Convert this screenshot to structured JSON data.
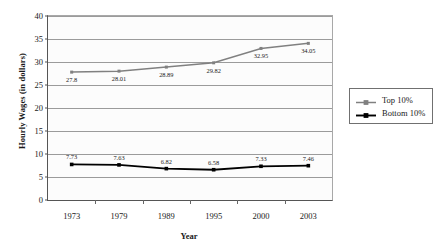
{
  "chart_data": {
    "type": "line",
    "title": "",
    "xlabel": "Year",
    "ylabel": "Hourly Wages (in dollars)",
    "categories": [
      "1973",
      "1979",
      "1989",
      "1995",
      "2000",
      "2003"
    ],
    "ylim": [
      0,
      40
    ],
    "yticks": [
      0,
      5,
      10,
      15,
      20,
      25,
      30,
      35,
      40
    ],
    "ytick_labels": [
      "0",
      "5",
      "10",
      "15",
      "20",
      "25",
      "30",
      "35",
      "40"
    ],
    "grid": "horizontal",
    "legend_position": "right",
    "series": [
      {
        "name": "Top 10%",
        "color": "#808080",
        "marker": "square",
        "values": [
          27.8,
          28.01,
          28.89,
          29.82,
          32.95,
          34.05
        ],
        "data_labels": [
          "27.8",
          "28.01",
          "28.89",
          "29.82",
          "32.95",
          "34.05"
        ]
      },
      {
        "name": "Bottom 10%",
        "color": "#000000",
        "marker": "square",
        "values": [
          7.73,
          7.63,
          6.82,
          6.58,
          7.33,
          7.46
        ],
        "data_labels": [
          "7.73",
          "7.63",
          "6.82",
          "6.58",
          "7.33",
          "7.46"
        ]
      }
    ]
  },
  "legend": {
    "items": [
      {
        "label": "Top 10%"
      },
      {
        "label": "Bottom 10%"
      }
    ]
  },
  "axes": {
    "y_title": "Hourly Wages (in dollars)",
    "x_title": "Year"
  }
}
